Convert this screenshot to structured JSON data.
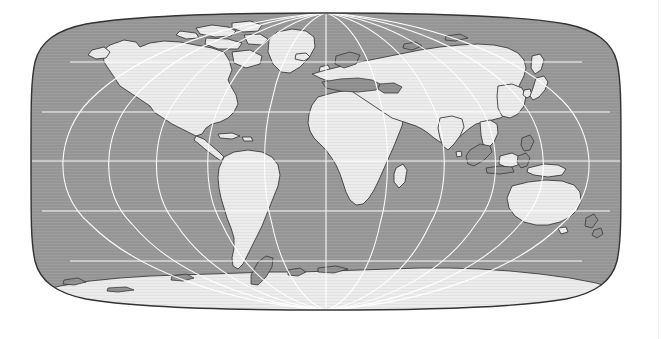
{
  "page": {
    "kind": "world-map-figure",
    "background_color": "#ffffff",
    "width": 663,
    "height": 339
  },
  "map": {
    "name": "world-map",
    "projection": "Robinson",
    "central_meridian": 0,
    "colors": {
      "ocean": "#959595",
      "ocean_texture": "#9c9c9c",
      "land": "#ececec",
      "land_shaded": "#8a8a8a",
      "coastline": "#3c3c3c",
      "graticule": "#ffffff",
      "frame": "#333333",
      "page_background": "#ffffff"
    },
    "frame": {
      "left": 32,
      "right": 620,
      "top": 13,
      "bottom": 310,
      "stroke_width": 1.4
    },
    "graticule": {
      "visible": true,
      "parallel_interval_deg": 30,
      "meridian_interval_deg": 30,
      "parallels_deg": [
        -60,
        -30,
        0,
        30,
        60
      ],
      "meridians_deg": [
        -150,
        -120,
        -90,
        -60,
        -30,
        0,
        30,
        60,
        90,
        120,
        150
      ],
      "stroke_color": "#ffffff",
      "stroke_width": 1.1
    },
    "labels": {
      "title": "",
      "legend": "",
      "axis_x": "",
      "axis_y": ""
    },
    "landmasses": [
      {
        "name": "north-america",
        "shaded": false
      },
      {
        "name": "south-america",
        "shaded": false
      },
      {
        "name": "greenland",
        "shaded": false
      },
      {
        "name": "canadian-arctic-islands",
        "shaded": false
      },
      {
        "name": "europe",
        "shaded": true
      },
      {
        "name": "africa",
        "shaded": false
      },
      {
        "name": "asia",
        "shaded": false
      },
      {
        "name": "india",
        "shaded": false
      },
      {
        "name": "indonesia",
        "shaded": true
      },
      {
        "name": "japan",
        "shaded": false
      },
      {
        "name": "australia",
        "shaded": false
      },
      {
        "name": "new-zealand",
        "shaded": true
      },
      {
        "name": "new-guinea",
        "shaded": false
      },
      {
        "name": "madagascar",
        "shaded": false
      },
      {
        "name": "antarctica",
        "shaded": false
      },
      {
        "name": "antarctic-peninsula",
        "shaded": true
      },
      {
        "name": "iceland",
        "shaded": false
      },
      {
        "name": "british-isles",
        "shaded": false
      },
      {
        "name": "caribbean-islands",
        "shaded": false
      },
      {
        "name": "philippines",
        "shaded": true
      },
      {
        "name": "sri-lanka",
        "shaded": false
      }
    ]
  },
  "decorations": {
    "right_edge_rule": {
      "name": "right-edge-rule",
      "x": 658,
      "color": "#f2f2f2",
      "visible": true
    }
  }
}
